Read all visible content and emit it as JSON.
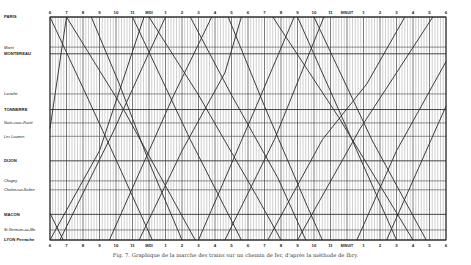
{
  "caption": "Fig. 7. Graphique de la marche des trains sur un chemin de fer, d'après la méthode de Ibry.",
  "colors": {
    "ink": "#2a2a2a",
    "grid": "#7a7a7a",
    "paper": "#ffffff"
  },
  "chart_data": {
    "type": "line",
    "title": "Graphique de la marche des trains sur un chemin de fer, d'après la méthode de Ibry",
    "xlabel": "Heures",
    "ylabel": "Stations (Paris → Lyon)",
    "x_ticks": [
      "6",
      "7",
      "8",
      "9",
      "10",
      "11",
      "MIDI",
      "1",
      "2",
      "3",
      "4",
      "5",
      "6",
      "7",
      "8",
      "9",
      "10",
      "11",
      "MINUIT",
      "1",
      "2",
      "3",
      "4",
      "5",
      "6"
    ],
    "x_range_hours": [
      6,
      30
    ],
    "grid": true,
    "stations": [
      {
        "name": "PARIS",
        "pos": 0.0,
        "style": "caps"
      },
      {
        "name": "Moret",
        "pos": 0.135,
        "style": "italic"
      },
      {
        "name": "MONTEREAU",
        "pos": 0.165,
        "style": "caps"
      },
      {
        "name": "Laroche",
        "pos": 0.345,
        "style": "italic"
      },
      {
        "name": "TONNERRE",
        "pos": 0.415,
        "style": "caps"
      },
      {
        "name": "Nuits-sous-Ravières",
        "pos": 0.475,
        "style": "italic"
      },
      {
        "name": "Les Laumes",
        "pos": 0.535,
        "style": "italic"
      },
      {
        "name": "DIJON",
        "pos": 0.645,
        "style": "caps"
      },
      {
        "name": "Chagny",
        "pos": 0.735,
        "style": "italic"
      },
      {
        "name": "Chalon-sur-Saône",
        "pos": 0.775,
        "style": "italic"
      },
      {
        "name": "MACON",
        "pos": 0.885,
        "style": "caps"
      },
      {
        "name": "St Germain-au-Mont-d'Or",
        "pos": 0.955,
        "style": "italic"
      },
      {
        "name": "LYON Perrache",
        "pos": 1.0,
        "style": "caps"
      }
    ],
    "series": [
      {
        "name": "Train descendant 1",
        "direction": "Paris→Lyon",
        "points": [
          [
            6.0,
            0.0
          ],
          [
            8.2,
            0.35
          ],
          [
            10.0,
            0.64
          ],
          [
            12.2,
            1.0
          ]
        ]
      },
      {
        "name": "Train descendant 2",
        "direction": "Paris→Lyon",
        "points": [
          [
            7.0,
            0.0
          ],
          [
            10.5,
            0.42
          ],
          [
            14.8,
            1.0
          ]
        ]
      },
      {
        "name": "Train descendant 3",
        "direction": "Paris→Lyon",
        "points": [
          [
            8.5,
            0.0
          ],
          [
            10.2,
            0.3
          ],
          [
            12.0,
            0.65
          ],
          [
            14.0,
            1.0
          ]
        ]
      },
      {
        "name": "Train descendant 4",
        "direction": "Paris→Lyon",
        "points": [
          [
            11.0,
            0.0
          ],
          [
            14.5,
            0.55
          ],
          [
            17.6,
            1.0
          ]
        ]
      },
      {
        "name": "Train descendant 5",
        "direction": "Paris→Lyon",
        "points": [
          [
            12.0,
            0.0
          ],
          [
            15.0,
            0.35
          ],
          [
            18.5,
            0.8
          ],
          [
            20.0,
            1.0
          ]
        ]
      },
      {
        "name": "Train descendant 6",
        "direction": "Paris→Lyon",
        "points": [
          [
            14.5,
            0.0
          ],
          [
            17.0,
            0.35
          ],
          [
            19.8,
            0.72
          ],
          [
            21.5,
            1.0
          ]
        ]
      },
      {
        "name": "Train descendant 7",
        "direction": "Paris→Lyon",
        "points": [
          [
            16.8,
            0.0
          ],
          [
            19.0,
            0.4
          ],
          [
            21.6,
            0.85
          ],
          [
            22.5,
            1.0
          ]
        ]
      },
      {
        "name": "Train descendant 8",
        "direction": "Paris→Lyon",
        "points": [
          [
            19.5,
            0.0
          ],
          [
            23.5,
            0.45
          ],
          [
            28.0,
            1.0
          ]
        ]
      },
      {
        "name": "Train descendant 9",
        "direction": "Paris→Lyon",
        "points": [
          [
            21.0,
            0.0
          ],
          [
            24.6,
            0.6
          ],
          [
            27.0,
            1.0
          ]
        ]
      },
      {
        "name": "Train descendant 10",
        "direction": "Paris→Lyon",
        "points": [
          [
            22.0,
            0.0
          ],
          [
            25.5,
            0.55
          ],
          [
            28.8,
            1.0
          ]
        ]
      },
      {
        "name": "Train montant 1",
        "direction": "Lyon→Paris",
        "points": [
          [
            6.0,
            0.88
          ],
          [
            6.8,
            1.0
          ]
        ]
      },
      {
        "name": "Train montant 2",
        "direction": "Lyon→Paris",
        "points": [
          [
            6.0,
            1.0
          ],
          [
            9.0,
            0.6
          ],
          [
            11.7,
            0.0
          ]
        ]
      },
      {
        "name": "Train montant 3",
        "direction": "Lyon→Paris",
        "points": [
          [
            6.0,
            0.5
          ],
          [
            7.0,
            0.0
          ]
        ]
      },
      {
        "name": "Train montant 4",
        "direction": "Lyon→Paris",
        "points": [
          [
            6.6,
            1.0
          ],
          [
            9.8,
            0.52
          ],
          [
            12.0,
            0.16
          ],
          [
            13.0,
            0.0
          ]
        ]
      },
      {
        "name": "Train montant 5",
        "direction": "Lyon→Paris",
        "points": [
          [
            9.6,
            1.0
          ],
          [
            13.5,
            0.35
          ],
          [
            15.8,
            0.0
          ]
        ]
      },
      {
        "name": "Train montant 6",
        "direction": "Lyon→Paris",
        "points": [
          [
            11.4,
            1.0
          ],
          [
            14.0,
            0.6
          ],
          [
            16.6,
            0.25
          ],
          [
            17.6,
            0.0
          ]
        ]
      },
      {
        "name": "Train montant 7",
        "direction": "Lyon→Paris",
        "points": [
          [
            15.0,
            1.0
          ],
          [
            18.5,
            0.4
          ],
          [
            20.8,
            0.0
          ]
        ]
      },
      {
        "name": "Train montant 8",
        "direction": "Lyon→Paris",
        "points": [
          [
            16.6,
            1.0
          ],
          [
            19.6,
            0.55
          ],
          [
            22.6,
            0.0
          ]
        ]
      },
      {
        "name": "Train montant 9",
        "direction": "Lyon→Paris",
        "points": [
          [
            19.2,
            1.0
          ],
          [
            22.5,
            0.55
          ],
          [
            25.2,
            0.3
          ],
          [
            27.5,
            0.0
          ]
        ]
      },
      {
        "name": "Train montant 10",
        "direction": "Lyon→Paris",
        "points": [
          [
            21.0,
            1.0
          ],
          [
            24.8,
            0.5
          ],
          [
            29.2,
            0.0
          ]
        ]
      },
      {
        "name": "Train montant 11",
        "direction": "Lyon→Paris",
        "points": [
          [
            24.6,
            1.0
          ],
          [
            27.0,
            0.6
          ],
          [
            30.0,
            0.2
          ]
        ]
      },
      {
        "name": "Train montant 12",
        "direction": "Lyon→Paris",
        "points": [
          [
            26.4,
            1.0
          ],
          [
            30.0,
            0.4
          ]
        ]
      }
    ]
  }
}
